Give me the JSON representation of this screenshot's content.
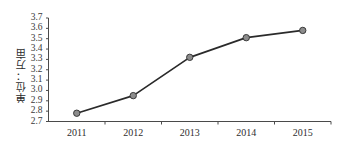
{
  "chart_data": {
    "type": "line",
    "title": "",
    "subtitle": "",
    "xlabel": "",
    "ylabel": "单位：万亩",
    "categories": [
      "2011",
      "2012",
      "2013",
      "2014",
      "2015"
    ],
    "values": [
      2.78,
      2.95,
      3.32,
      3.51,
      3.58
    ],
    "series": [
      {
        "name": "",
        "values": [
          2.78,
          2.95,
          3.32,
          3.51,
          3.58
        ]
      }
    ],
    "ylim": [
      2.7,
      3.7
    ],
    "ytick_labels": [
      "3.7",
      "3.6",
      "3.5",
      "3.4",
      "3.3",
      "3.2",
      "3.1",
      "3.0",
      "2.9",
      "2.8",
      "2.7"
    ],
    "ytick_values": [
      3.7,
      3.6,
      3.5,
      3.4,
      3.3,
      3.2,
      3.1,
      3.0,
      2.9,
      2.8,
      2.7
    ],
    "ytick_step": 0.1,
    "grid": false,
    "legend": false,
    "legend_position": "none",
    "annotations": [],
    "colors": {
      "line": "#2a2a2a",
      "marker_fill": "#8c8c8c",
      "marker_stroke": "#3a3a3a",
      "axis": "#4a4a4a",
      "text": "#2e2e2e",
      "background": "#ffffff"
    }
  },
  "axis": {
    "y_title": "单位：万亩"
  }
}
